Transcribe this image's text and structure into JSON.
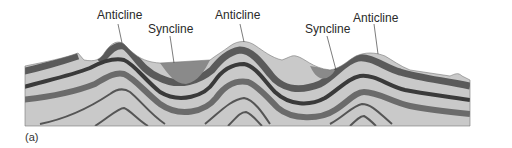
{
  "figure": {
    "caption": "(a)",
    "labels": [
      {
        "id": "anticline-1",
        "text": "Anticline"
      },
      {
        "id": "syncline-1",
        "text": "Syncline"
      },
      {
        "id": "anticline-2",
        "text": "Anticline"
      },
      {
        "id": "syncline-2",
        "text": "Syncline"
      },
      {
        "id": "anticline-3",
        "text": "Anticline"
      }
    ],
    "colors": {
      "light_layer": "#c9c9c9",
      "mid_layer": "#8f8f8f",
      "dark_layer": "#3a3a3a",
      "syncline_fill": "#8a8a8a",
      "leader_line": "#444444"
    }
  }
}
